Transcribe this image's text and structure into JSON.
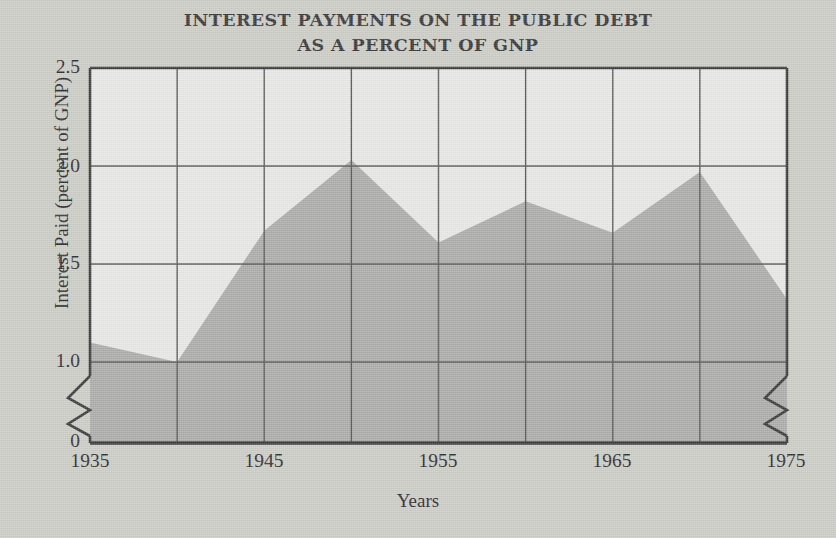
{
  "chart_data": {
    "type": "area",
    "title_line1": "INTEREST PAYMENTS ON THE PUBLIC DEBT",
    "title_line2": "AS A PERCENT OF GNP",
    "xlabel": "Years",
    "ylabel": "Interest Paid (percent of GNP)",
    "x": [
      1935,
      1940,
      1945,
      1950,
      1955,
      1960,
      1965,
      1970,
      1975
    ],
    "values": [
      1.1,
      1.0,
      1.67,
      2.03,
      1.61,
      1.82,
      1.66,
      1.97,
      1.32
    ],
    "series": [
      {
        "name": "Interest paid as percent of GNP",
        "values": [
          1.1,
          1.0,
          1.67,
          2.03,
          1.61,
          1.82,
          1.66,
          1.97,
          1.32
        ]
      }
    ],
    "ylim": [
      0,
      2.5
    ],
    "xlim": [
      1935,
      1975
    ],
    "y_ticks": [
      "0",
      "1.0",
      "1.5",
      "2.0",
      "2.5"
    ],
    "y_tick_values": [
      0,
      1.0,
      1.5,
      2.0,
      2.5
    ],
    "x_ticks": [
      "1935",
      "1945",
      "1955",
      "1965",
      "1975"
    ],
    "x_tick_values": [
      1935,
      1945,
      1955,
      1965,
      1975
    ],
    "x_gridline_values": [
      1935,
      1940,
      1945,
      1950,
      1955,
      1960,
      1965,
      1970,
      1975
    ],
    "axis_break": true,
    "axis_break_between": [
      0,
      1.0
    ],
    "grid": true,
    "legend": "none",
    "colors": {
      "area_fill": "#adadac",
      "plot_background": "#e8e8e6",
      "page_background": "#cdcdc8",
      "axis": "#3c3c3c",
      "gridline": "#555555",
      "text": "#2f2f2f"
    }
  }
}
